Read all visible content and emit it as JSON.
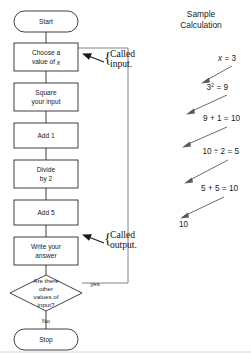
{
  "figure": {
    "title_right_panel": "Sample\nCalculation",
    "right_panel_title_line1": "Sample",
    "right_panel_title_line2": "Calculation"
  },
  "flowchart": {
    "nodes": [
      {
        "id": "start",
        "type": "terminator",
        "label": "Start"
      },
      {
        "id": "choose",
        "type": "process",
        "label_line1": "Choose a",
        "label_line2": "value of x"
      },
      {
        "id": "square",
        "type": "process",
        "label_line1": "Square",
        "label_line2": "your input"
      },
      {
        "id": "add1",
        "type": "process",
        "label_line1": "Add 1",
        "label_line2": ""
      },
      {
        "id": "divide",
        "type": "process",
        "label_line1": "Divide",
        "label_line2": "by 2"
      },
      {
        "id": "add5",
        "type": "process",
        "label_line1": "Add 5",
        "label_line2": ""
      },
      {
        "id": "write",
        "type": "process",
        "label_line1": "Write your",
        "label_line2": "answer"
      },
      {
        "id": "decision",
        "type": "decision",
        "label_line1": "Are there",
        "label_line2": "other",
        "label_line3": "values of",
        "label_line4": "input?"
      },
      {
        "id": "stop",
        "type": "terminator",
        "label": "Stop"
      }
    ],
    "edge_labels": {
      "yes": "yes",
      "no": "No"
    },
    "annotations": [
      {
        "id": "called-input",
        "line1": "Called",
        "line2": "input."
      },
      {
        "id": "called-output",
        "line1": "Called",
        "line2": "output."
      }
    ]
  },
  "sample_calculation": {
    "steps": [
      {
        "id": "step-x",
        "text": "x = 3",
        "var": "x",
        "rest": " = 3"
      },
      {
        "id": "step-square",
        "text": "3² = 9",
        "base": "3",
        "exp": "2",
        "rest": " = 9"
      },
      {
        "id": "step-add1",
        "text": "9 + 1 = 10"
      },
      {
        "id": "step-divide",
        "text": "10 ÷ 2 = 5"
      },
      {
        "id": "step-add5",
        "text": "5 + 5 = 10"
      },
      {
        "id": "step-result",
        "text": "10"
      }
    ]
  },
  "colors": {
    "ink": "#2b2b2b",
    "text": "#1a1a1a",
    "loop_line": "#767676",
    "calc_arrow": "#5a5a5a",
    "background": "#ffffff"
  }
}
